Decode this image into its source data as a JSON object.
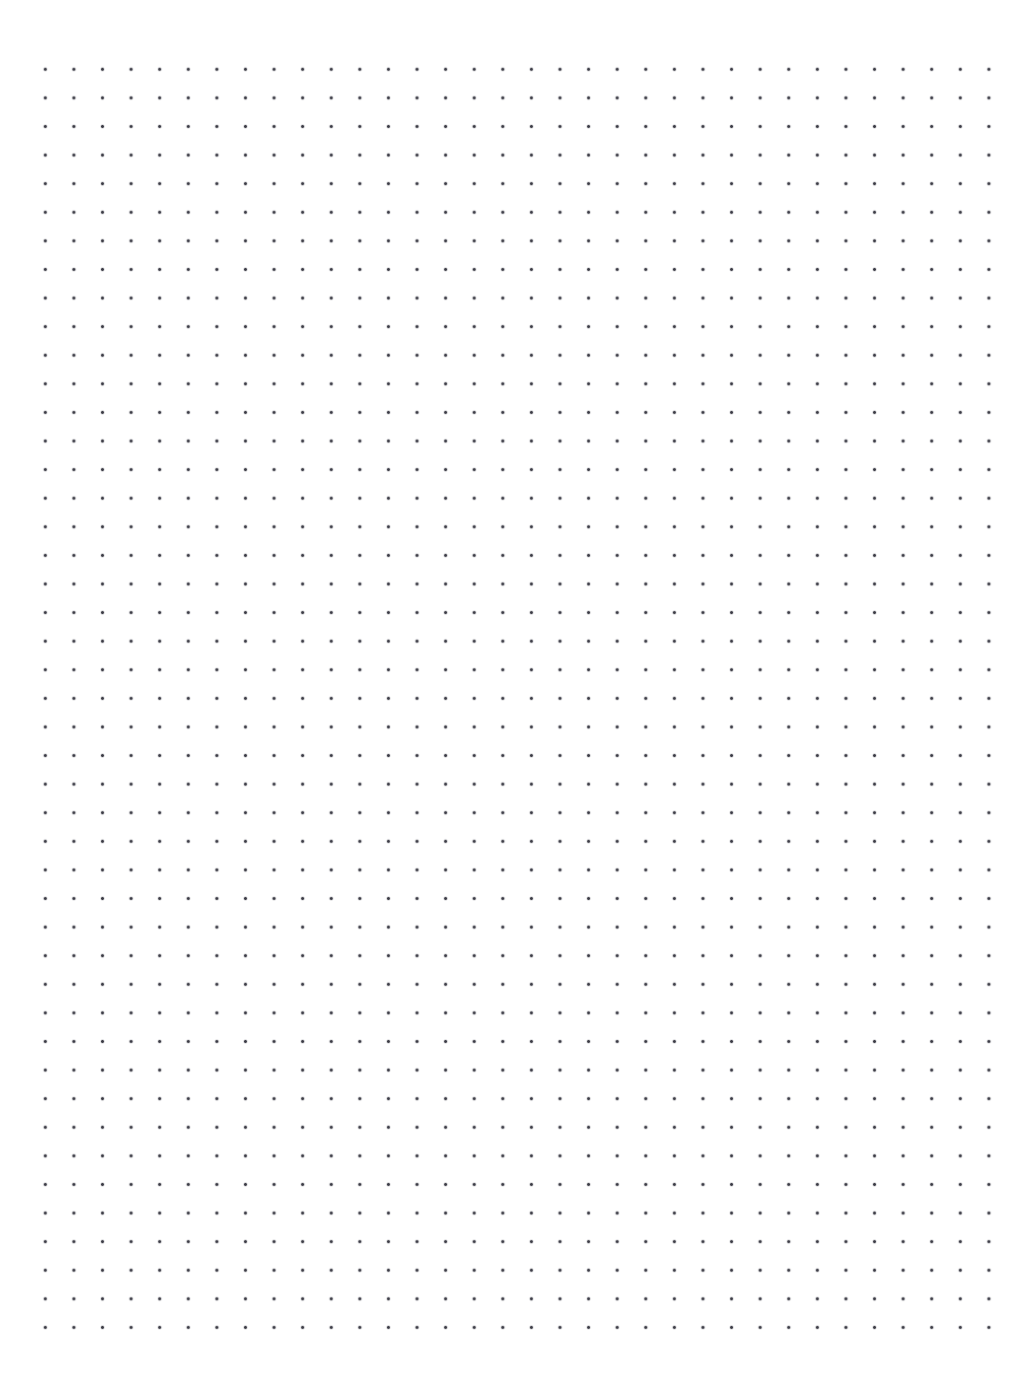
{
  "page": {
    "kind": "dot-grid-paper",
    "width_px": 1034,
    "height_px": 1388,
    "background_color": "#ffffff",
    "has_text": false,
    "has_border": false,
    "notes": []
  },
  "grid": {
    "dot_color": "#3c3c46",
    "dot_diameter_px": 2,
    "spacing_x_px": 28.6,
    "spacing_y_px": 28.6,
    "origin_x_px": 32,
    "origin_y_px": 56,
    "columns": 35,
    "rows": 46,
    "margin_left_px": 32,
    "margin_top_px": 56,
    "margin_right_px": 23,
    "margin_bottom_px": 48
  },
  "chart_data": {
    "type": "scatter",
    "title": "",
    "xlabel": "",
    "ylabel": "",
    "grid": true,
    "legend": "none",
    "xlim": [
      32,
      1004.4
    ],
    "ylim": [
      56,
      1343
    ],
    "x_tick_spacing": 28.6,
    "y_tick_spacing": 28.6,
    "point_count": 1610,
    "series": [
      {
        "name": "dot-lattice",
        "marker": "square",
        "marker_size_px": 2,
        "color": "#3c3c46"
      }
    ]
  }
}
